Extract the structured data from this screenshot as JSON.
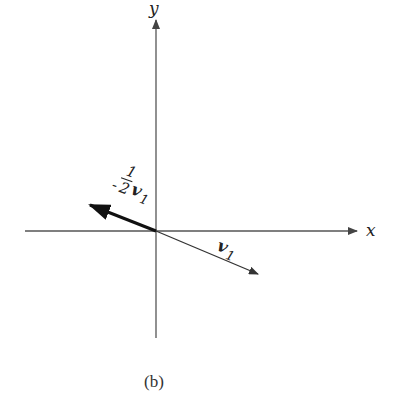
{
  "diagram": {
    "type": "vector-plane",
    "caption": "(b)",
    "axes": {
      "x_label": "x",
      "y_label": "y",
      "color": "#555555",
      "origin": {
        "x": 156,
        "y": 231
      }
    },
    "vectors": [
      {
        "name": "v1",
        "label_main": "v",
        "label_sub": "1",
        "from": [
          156,
          231
        ],
        "to": [
          258,
          274
        ],
        "stroke_width": 1.3,
        "color": "#333333"
      },
      {
        "name": "-1/2 v1",
        "label_coef_num": "1",
        "label_coef_den": "2",
        "label_sign": "-",
        "label_main": "v",
        "label_sub": "1",
        "from": [
          156,
          231
        ],
        "to": [
          88,
          204
        ],
        "stroke_width": 3,
        "color": "#111111"
      }
    ]
  }
}
